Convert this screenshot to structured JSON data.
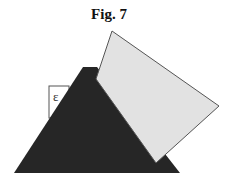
{
  "figure": {
    "title": "Fig. 7",
    "label_box": {
      "text": "ε"
    },
    "shapes": {
      "dark_triangle": {
        "color": "#262626",
        "points": "83,67 97,67 180,173 14,173"
      },
      "light_quad": {
        "color": "#e2e2e2",
        "stroke": "#555555",
        "points": "112,31 219,106 156,163 96,79"
      },
      "label_rect": {
        "x": 49,
        "y": 86,
        "width": 20,
        "height": 32
      }
    }
  }
}
